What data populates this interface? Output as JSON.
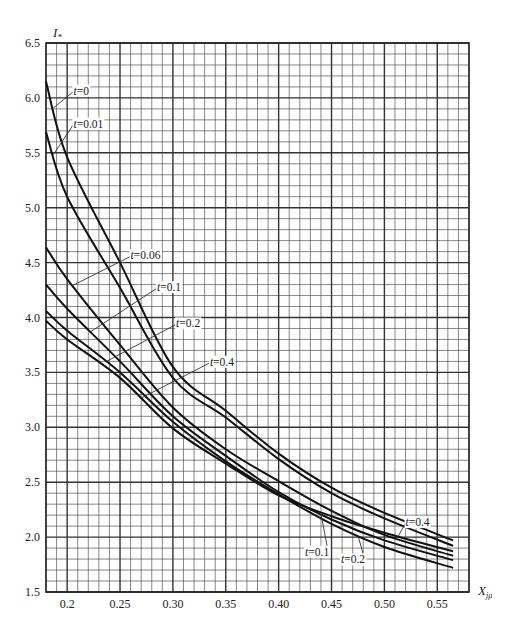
{
  "chart_data": {
    "type": "line",
    "title": "",
    "xlabel": "X_jμ",
    "ylabel": "I_*",
    "xlim": [
      0.18,
      0.58
    ],
    "ylim": [
      1.5,
      6.5
    ],
    "grid": true,
    "x_ticks": [
      "0.2",
      "0.25",
      "0.30",
      "0.35",
      "0.40",
      "0.45",
      "0.50",
      "0.55"
    ],
    "x_tick_values": [
      0.2,
      0.25,
      0.3,
      0.35,
      0.4,
      0.45,
      0.5,
      0.55
    ],
    "y_ticks": [
      "1.5",
      "2.0",
      "2.5",
      "3.0",
      "3.5",
      "4.0",
      "4.5",
      "5.0",
      "5.5",
      "6.0",
      "6.5"
    ],
    "y_tick_values": [
      1.5,
      2.0,
      2.5,
      3.0,
      3.5,
      4.0,
      4.5,
      5.0,
      5.5,
      6.0,
      6.5
    ],
    "x": [
      0.18,
      0.2,
      0.25,
      0.3,
      0.35,
      0.4,
      0.45,
      0.5,
      0.565
    ],
    "series": [
      {
        "name": "t=0",
        "values": [
          6.15,
          5.46,
          4.5,
          3.55,
          3.15,
          2.76,
          2.45,
          2.22,
          1.97
        ]
      },
      {
        "name": "t=0.01",
        "values": [
          5.69,
          5.1,
          4.27,
          3.45,
          3.09,
          2.71,
          2.4,
          2.17,
          1.92
        ]
      },
      {
        "name": "t=0.06",
        "values": [
          4.64,
          4.35,
          3.75,
          3.18,
          2.8,
          2.51,
          2.24,
          2.02,
          1.83
        ]
      },
      {
        "name": "t=0.1",
        "values": [
          4.3,
          4.08,
          3.6,
          3.1,
          2.74,
          2.41,
          2.16,
          1.97,
          1.79
        ]
      },
      {
        "name": "t=0.2",
        "values": [
          4.06,
          3.88,
          3.5,
          3.05,
          2.69,
          2.39,
          2.12,
          1.91,
          1.72
        ]
      },
      {
        "name": "t=0.4",
        "values": [
          3.97,
          3.8,
          3.45,
          2.99,
          2.67,
          2.38,
          2.19,
          2.04,
          1.87
        ]
      }
    ],
    "annotations": [
      {
        "text": "t=0",
        "x": 0.206,
        "y": 6.03,
        "points_to": "t=0"
      },
      {
        "text": "t=0.01",
        "x": 0.206,
        "y": 5.73,
        "points_to": "t=0.01"
      },
      {
        "text": "t=0.06",
        "x": 0.26,
        "y": 4.53,
        "points_to": "t=0.06"
      },
      {
        "text": "t=0.1",
        "x": 0.285,
        "y": 4.24,
        "points_to": "t=0.1"
      },
      {
        "text": "t=0.2",
        "x": 0.303,
        "y": 3.91,
        "points_to": "t=0.2"
      },
      {
        "text": "t=0.4",
        "x": 0.335,
        "y": 3.56,
        "points_to": "t=0.4"
      },
      {
        "text": "t=0.4",
        "x": 0.52,
        "y": 2.1,
        "points_to": "t=0.4"
      },
      {
        "text": "t=0.1",
        "x": 0.425,
        "y": 1.83,
        "points_to": "t=0.1"
      },
      {
        "text": "t=0.2",
        "x": 0.459,
        "y": 1.76,
        "points_to": "t=0.2"
      }
    ]
  },
  "labels": {
    "ylabel_main": "I",
    "ylabel_sub": "*",
    "xlabel_main": "X",
    "xlabel_sub": "jμ"
  }
}
